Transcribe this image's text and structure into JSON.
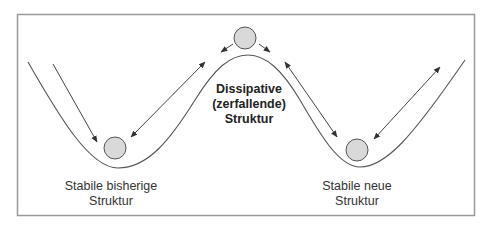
{
  "diagram": {
    "labels": {
      "left": {
        "line1": "Stabile bisherige",
        "line2": "Struktur"
      },
      "center": {
        "line1": "Dissipative",
        "line2": "(zerfallende)",
        "line3": "Struktur"
      },
      "right": {
        "line1": "Stabile neue",
        "line2": "Struktur"
      }
    },
    "nodes": [
      {
        "id": "ball-left",
        "label": "Stabile bisherige Struktur"
      },
      {
        "id": "ball-top",
        "label": "Dissipative (zerfallende) Struktur"
      },
      {
        "id": "ball-right",
        "label": "Stabile neue Struktur"
      }
    ],
    "colors": {
      "ball_fill": "#d9d9d9",
      "stroke": "#555555",
      "frame": "#999999",
      "text": "#333333"
    }
  }
}
